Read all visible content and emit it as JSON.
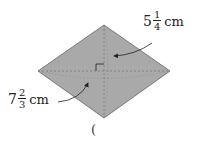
{
  "figure": {
    "shape": "rhombus",
    "fill_color": "#a9a9a9",
    "stroke_color": "#555555",
    "vertices": {
      "top": [
        104,
        25
      ],
      "right": [
        170,
        71
      ],
      "bottom": [
        104,
        118
      ],
      "left": [
        38,
        71
      ]
    },
    "diagonals": "dashed",
    "right_angle_marker": true
  },
  "labels": {
    "top_measure": {
      "whole": "5",
      "numerator": "1",
      "denominator": "4",
      "unit": "cm"
    },
    "left_measure": {
      "whole": "7",
      "numerator": "2",
      "denominator": "3",
      "unit": "cm"
    }
  },
  "answer_blank": {
    "text": "("
  }
}
